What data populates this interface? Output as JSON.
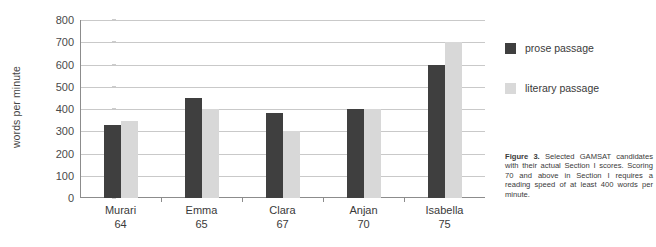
{
  "chart_data": {
    "type": "bar",
    "title": "",
    "xlabel": "",
    "ylabel": "words per minute",
    "ylim": [
      0,
      800
    ],
    "yticks": [
      800,
      700,
      600,
      500,
      400,
      300,
      200,
      100,
      0
    ],
    "grid": true,
    "legend_position": "right",
    "categories": [
      "Murari",
      "Emma",
      "Clara",
      "Anjan",
      "Isabella"
    ],
    "category_scores": [
      "64",
      "65",
      "67",
      "70",
      "75"
    ],
    "series": [
      {
        "name": "prose passage",
        "color": "#3f3f3f",
        "values": [
          330,
          450,
          380,
          400,
          600
        ]
      },
      {
        "name": "literary passage",
        "color": "#d8d8d8",
        "values": [
          345,
          400,
          300,
          400,
          700
        ]
      }
    ]
  },
  "legend": {
    "items": [
      {
        "label": "prose passage",
        "color": "#3f3f3f"
      },
      {
        "label": "literary passage",
        "color": "#d9d9d9"
      }
    ]
  },
  "caption": {
    "label": "Figure 3.",
    "text": "Selected GAMSAT candidates with their actual Section I scores. Scoring 70 and above in Section I requires a reading speed of at least 400 words per minute."
  }
}
